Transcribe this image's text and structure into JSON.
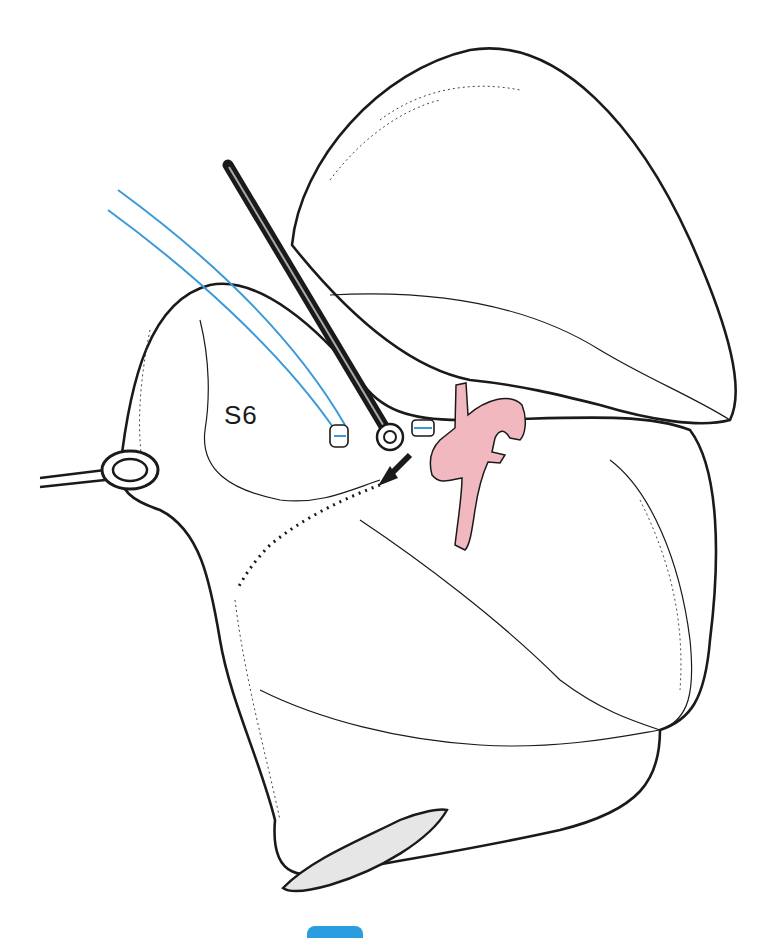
{
  "figure": {
    "labels": {
      "segment": "S6"
    },
    "elements": {
      "lung": "lung-lobes",
      "stapler": "endoscopic-stapler",
      "forceps": "ring-forceps",
      "artery": "pulmonary-artery",
      "ligatures": "vessel-ligatures",
      "dividing_line": "intersegmental-plane",
      "arrow": "stapler-direction-arrow"
    },
    "colors": {
      "artery": "#f2b8c0",
      "ligature": "#3a9ad9",
      "outline": "#1a1a1a",
      "tab": "#2a9de0"
    }
  }
}
